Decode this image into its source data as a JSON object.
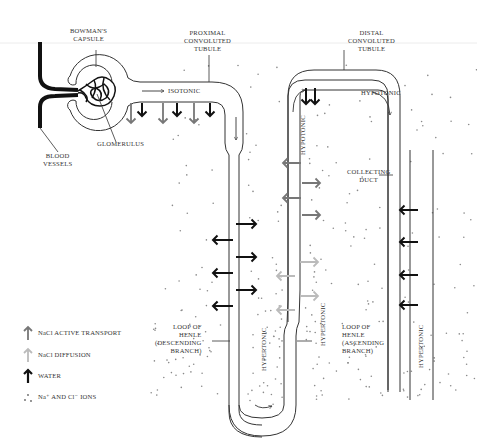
{
  "labels": {
    "bowmans_capsule": [
      "BOWMAN'S",
      "CAPSULE"
    ],
    "proximal_tubule": [
      "PROXIMAL",
      "CONVOLUTED",
      "TUBULE"
    ],
    "distal_tubule": [
      "DISTAL",
      "CONVOLUTED",
      "TUBULE"
    ],
    "glomerulus": "GLOMERULUS",
    "blood_vessels": [
      "BLOOD",
      "VESSELS"
    ],
    "isotonic": "ISOTONIC",
    "hypotonic_top": "HYPOTONIC",
    "hypotonic_vertical": "HYPOTONIC",
    "collecting_duct": [
      "COLLECTING",
      "DUCT"
    ],
    "loop_descending": [
      "LOOP OF",
      "HENLE",
      "(DESCENDING",
      "BRANCH)"
    ],
    "loop_ascending": [
      "LOOP OF",
      "HENLE",
      "(ASCENDING",
      "BRANCH)"
    ],
    "hypertonic_descending": "HYPERTONIC",
    "hypertonic_ascending": "HYPERTONIC",
    "hypertonic_collecting": "HYPERTONIC"
  },
  "legend": [
    {
      "icon": "nacl-active-transport-arrow",
      "label": "NaCl ACTIVE TRANSPORT",
      "color": "#777777"
    },
    {
      "icon": "nacl-diffusion-arrow",
      "label": "NaCl DIFFUSION",
      "color": "#bbbbbb"
    },
    {
      "icon": "water-arrow",
      "label": "WATER",
      "color": "#111111"
    },
    {
      "icon": "ion-dots",
      "label": "Na⁺ AND Cl⁻ IONS",
      "color": "#666666"
    }
  ],
  "colors": {
    "line": "#333333",
    "active_transport": "#777777",
    "diffusion": "#bbbbbb",
    "water": "#111111",
    "ions": "#777777"
  }
}
